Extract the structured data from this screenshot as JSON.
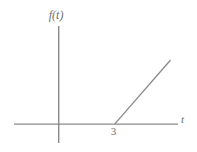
{
  "figure": {
    "background_color": "#ffffff",
    "line_color": "#8a8a8a",
    "text_color": "#6f6f6f",
    "width": 197,
    "height": 152
  },
  "labels": {
    "y_axis": "f(t)",
    "x_axis": "t",
    "breakpoint_tick": "3"
  },
  "chart_data": {
    "type": "line",
    "title": "",
    "xlabel": "t",
    "ylabel": "f(t)",
    "xlim": [
      -2.4,
      6.4
    ],
    "ylim": [
      -1.0,
      5.2
    ],
    "grid": false,
    "legend": null,
    "x_ticks": [
      3
    ],
    "x_tick_labels": [
      "3"
    ],
    "y_ticks": [],
    "y_tick_labels": [],
    "annotations": [],
    "series": [
      {
        "name": "f(t) = ramp at t = 3",
        "description": "Zero for t < 3, then a straight line rising with positive slope for t >= 3",
        "x": [
          -2.0,
          3.0,
          6.0
        ],
        "y": [
          0.0,
          0.0,
          3.4
        ]
      }
    ]
  }
}
